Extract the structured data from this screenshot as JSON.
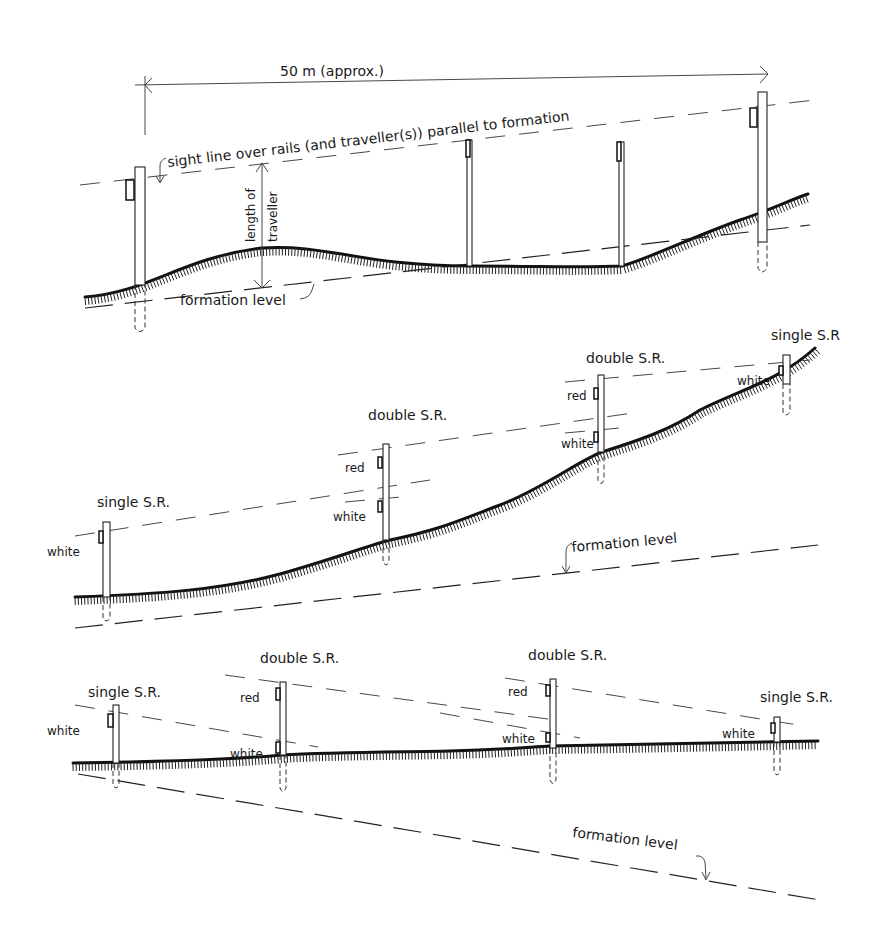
{
  "diagram": {
    "colors": {
      "ink": "#1a1a1a",
      "background": "#ffffff"
    },
    "panel_top": {
      "dimension_label": "50 m (approx.)",
      "sight_line_label": "sight line over rails (and traveller(s)) parallel to formation",
      "traveller_label_line1": "length of",
      "traveller_label_line2": "traveller",
      "formation_label": "formation level"
    },
    "panel_middle": {
      "formation_label": "formation level",
      "rails": [
        {
          "type_label": "single S.R.",
          "board_labels": [
            "white"
          ]
        },
        {
          "type_label": "double S.R.",
          "board_labels": [
            "red",
            "white"
          ]
        },
        {
          "type_label": "double S.R.",
          "board_labels": [
            "red",
            "white"
          ]
        },
        {
          "type_label": "single S.R",
          "board_labels": [
            "white"
          ]
        }
      ]
    },
    "panel_bottom": {
      "formation_label": "formation level",
      "rails": [
        {
          "type_label": "single S.R.",
          "board_labels": [
            "white"
          ]
        },
        {
          "type_label": "double S.R.",
          "board_labels": [
            "red",
            "white"
          ]
        },
        {
          "type_label": "double S.R.",
          "board_labels": [
            "red",
            "white"
          ]
        },
        {
          "type_label": "single S.R.",
          "board_labels": [
            "white"
          ]
        }
      ]
    }
  }
}
